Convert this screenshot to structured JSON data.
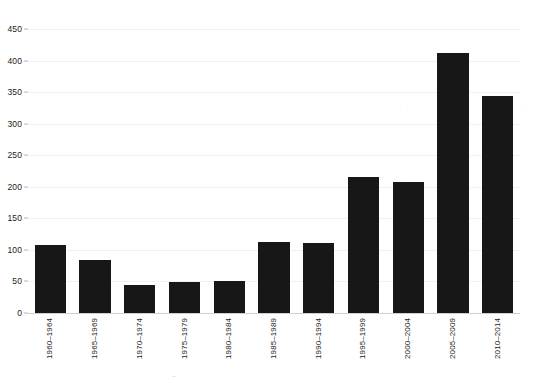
{
  "chart_data": {
    "type": "bar",
    "title": "",
    "subtitle": "",
    "xlabel": "",
    "ylabel": "",
    "categories": [
      "1960–1964",
      "1965–1969",
      "1970–1974",
      "1975–1979",
      "1980–1984",
      "1985–1989",
      "1990–1994",
      "1995–1999",
      "2000–2004",
      "2005–2009",
      "2010–2014"
    ],
    "values": [
      108,
      84,
      44,
      49,
      51,
      112,
      111,
      215,
      207,
      412,
      344
    ],
    "ylim": [
      0,
      450
    ],
    "ytick_step": 50,
    "yticks": [
      0,
      50,
      100,
      150,
      200,
      250,
      300,
      350,
      400,
      450
    ],
    "ytick_labels": [
      "0",
      "50",
      "100",
      "150",
      "200",
      "250",
      "300",
      "350",
      "400",
      "450"
    ],
    "grid": true,
    "grid_axis": "y",
    "legend": false,
    "legend_position": "none",
    "bar_color": "#171717",
    "grid_color": "#f1f1f1",
    "axis_color": "#cfcfcf",
    "background_color": "#ffffff",
    "text_color": "#1c1c1c",
    "xtick_label_rotation": 90,
    "bar_width_ratio": 0.7
  }
}
